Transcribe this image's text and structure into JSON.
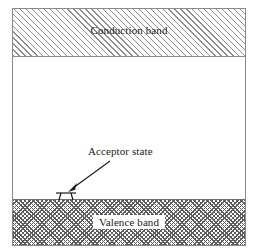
{
  "figure": {
    "type": "semiconductor-band-diagram",
    "background_color": "#ffffff",
    "frame_color": "#8a8a8a"
  },
  "bands": {
    "conduction": {
      "label": "Conduction band",
      "hatch": "diagonal-single",
      "hatch_color": "#8d8d8d"
    },
    "valence": {
      "label": "Valence band",
      "hatch": "crosshatch-dense",
      "hatch_color": "#5d5d5d"
    },
    "gap": {
      "label": ""
    }
  },
  "annotations": {
    "acceptor": {
      "label": "Acceptor state",
      "arrow": "arrow-down-left",
      "symbol": "acceptor-level-symbol"
    }
  }
}
